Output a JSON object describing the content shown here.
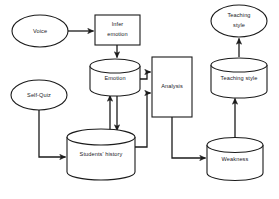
{
  "diagram": {
    "background_color": "#ffffff",
    "stroke_color": "#1b1b1b",
    "text_color": "#20201f",
    "nodes": {
      "voice": {
        "label": "Voice",
        "shape": "ellipse"
      },
      "infer_emotion": {
        "label_line1": "Infer",
        "label_line2": "emotion",
        "shape": "rectangle"
      },
      "emotion_store": {
        "label": "Emotion",
        "shape": "cylinder"
      },
      "self_quiz": {
        "label": "Self-Quiz",
        "shape": "ellipse"
      },
      "students_history": {
        "label": "Students' history",
        "shape": "cylinder"
      },
      "analysis": {
        "label": "Analysis",
        "shape": "rectangle"
      },
      "weakness_store": {
        "label": "Weakness",
        "shape": "cylinder"
      },
      "teaching_style_store": {
        "label": "Teaching style",
        "shape": "cylinder"
      },
      "teaching_style_output": {
        "label_line1": "Teaching",
        "label_line2": "style",
        "shape": "ellipse"
      }
    },
    "edges": [
      {
        "name": "voice-to-infer-emotion",
        "from": "voice",
        "to": "infer_emotion"
      },
      {
        "name": "infer-emotion-to-emotion-store",
        "from": "infer_emotion",
        "to": "emotion_store"
      },
      {
        "name": "emotion-store-to-analysis",
        "from": "emotion_store",
        "to": "analysis"
      },
      {
        "name": "students-history-to-emotion-store",
        "from": "students_history",
        "to": "emotion_store"
      },
      {
        "name": "emotion-store-to-students-history",
        "from": "emotion_store",
        "to": "students_history"
      },
      {
        "name": "self-quiz-to-students-history",
        "from": "self_quiz",
        "to": "students_history"
      },
      {
        "name": "students-history-to-analysis",
        "from": "students_history",
        "to": "analysis"
      },
      {
        "name": "analysis-to-weakness-store",
        "from": "analysis",
        "to": "weakness_store"
      },
      {
        "name": "weakness-store-to-teaching-style-store",
        "from": "weakness_store",
        "to": "teaching_style_store"
      },
      {
        "name": "teaching-style-store-to-teaching-style-output",
        "from": "teaching_style_store",
        "to": "teaching_style_output"
      }
    ]
  }
}
